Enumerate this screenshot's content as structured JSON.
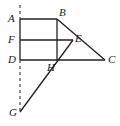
{
  "figure": {
    "type": "geometry-diagram",
    "width": 120,
    "height": 126,
    "background_color": "#ffffff",
    "stroke_color": "#231f20",
    "label_color": "#1a1a1a",
    "points": {
      "A": {
        "label": "A",
        "x": 20,
        "y": 19,
        "label_x": 8,
        "label_y": 13
      },
      "B": {
        "label": "B",
        "x": 57,
        "y": 19,
        "label_x": 59,
        "label_y": 7
      },
      "F": {
        "label": "F",
        "x": 20,
        "y": 40,
        "label_x": 8,
        "label_y": 34
      },
      "E": {
        "label": "E",
        "x": 73,
        "y": 40,
        "label_x": 75,
        "label_y": 33
      },
      "D": {
        "label": "D",
        "x": 20,
        "y": 60,
        "label_x": 8,
        "label_y": 54
      },
      "H": {
        "label": "H",
        "x": 57,
        "y": 60,
        "label_x": 47,
        "label_y": 62
      },
      "C": {
        "label": "C",
        "x": 105,
        "y": 60,
        "label_x": 108,
        "label_y": 54
      },
      "G": {
        "label": "G",
        "x": 20,
        "y": 112,
        "label_x": 9,
        "label_y": 107
      }
    },
    "segments": [
      {
        "name": "segment-AB",
        "from": "A",
        "to": "B",
        "style": "solid"
      },
      {
        "name": "segment-AD",
        "from": "A",
        "to": "D",
        "style": "solid"
      },
      {
        "name": "segment-FE",
        "from": "F",
        "to": "E",
        "style": "solid"
      },
      {
        "name": "segment-BH",
        "from": "B",
        "to": "H",
        "style": "solid"
      },
      {
        "name": "segment-DC",
        "from": "D",
        "to": "C",
        "style": "solid"
      },
      {
        "name": "segment-BC",
        "from": "B",
        "to": "C",
        "style": "solid"
      },
      {
        "name": "segment-GE",
        "from": "G",
        "to": "E",
        "style": "solid"
      },
      {
        "name": "segment-DG",
        "from": "D",
        "to": "G",
        "style": "dashed"
      }
    ],
    "dashed_stub": {
      "name": "dashed-stub-above-A",
      "x": 20,
      "y1": 5,
      "y2": 19
    }
  }
}
